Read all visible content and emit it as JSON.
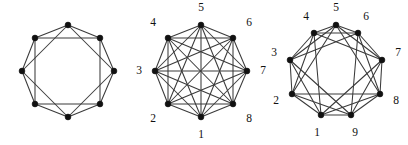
{
  "panel": {
    "name": "three-graph-figure-panel",
    "background_color": "#ffffff",
    "edge_color": "#3a3a3a",
    "vertex_color": "#111111",
    "label_color": "#111111"
  },
  "chart_data": [
    {
      "type": "diagram",
      "subtype": "graph-node-link",
      "name": "figure-1",
      "title": "",
      "labels_shown": false,
      "vertex_count": 8,
      "layout": "circular",
      "center": [
        68,
        71
      ],
      "radius": 46,
      "angle_offset_deg": -90,
      "vertex_labels": [],
      "vertex_positions": [
        [
          68,
          25
        ],
        [
          100,
          38
        ],
        [
          114,
          71
        ],
        [
          100,
          104
        ],
        [
          68,
          117
        ],
        [
          35,
          104
        ],
        [
          22,
          71
        ],
        [
          35,
          38
        ]
      ],
      "connection_distances": [
        1,
        2
      ],
      "edges": [
        [
          0,
          1
        ],
        [
          1,
          2
        ],
        [
          2,
          3
        ],
        [
          3,
          4
        ],
        [
          4,
          5
        ],
        [
          5,
          6
        ],
        [
          6,
          7
        ],
        [
          7,
          0
        ],
        [
          0,
          2
        ],
        [
          1,
          3
        ],
        [
          2,
          4
        ],
        [
          3,
          5
        ],
        [
          4,
          6
        ],
        [
          5,
          7
        ],
        [
          6,
          0
        ],
        [
          7,
          1
        ]
      ],
      "edge_count": 16
    },
    {
      "type": "diagram",
      "subtype": "graph-node-link",
      "name": "figure-2",
      "title": "",
      "labels_shown": true,
      "vertex_count": 8,
      "layout": "circular",
      "center": [
        68,
        71
      ],
      "radius": 46,
      "angle_offset_deg": 90,
      "vertex_labels": [
        "1",
        "2",
        "3",
        "4",
        "5",
        "6",
        "7",
        "8"
      ],
      "vertex_positions": [
        [
          68,
          117
        ],
        [
          35,
          104
        ],
        [
          22,
          71
        ],
        [
          35,
          38
        ],
        [
          68,
          25
        ],
        [
          100,
          38
        ],
        [
          114,
          71
        ],
        [
          100,
          104
        ]
      ],
      "label_positions": [
        [
          68,
          135
        ],
        [
          20,
          119
        ],
        [
          6,
          71
        ],
        [
          20,
          23
        ],
        [
          68,
          8
        ],
        [
          116,
          23
        ],
        [
          130,
          71
        ],
        [
          116,
          119
        ]
      ],
      "connection_distances": [
        1,
        2,
        3,
        4
      ],
      "graph_name": "K8",
      "edges": [
        [
          0,
          1
        ],
        [
          0,
          2
        ],
        [
          0,
          3
        ],
        [
          0,
          4
        ],
        [
          0,
          5
        ],
        [
          0,
          6
        ],
        [
          0,
          7
        ],
        [
          1,
          2
        ],
        [
          1,
          3
        ],
        [
          1,
          4
        ],
        [
          1,
          5
        ],
        [
          1,
          6
        ],
        [
          1,
          7
        ],
        [
          2,
          3
        ],
        [
          2,
          4
        ],
        [
          2,
          5
        ],
        [
          2,
          6
        ],
        [
          2,
          7
        ],
        [
          3,
          4
        ],
        [
          3,
          5
        ],
        [
          3,
          6
        ],
        [
          3,
          7
        ],
        [
          4,
          5
        ],
        [
          4,
          6
        ],
        [
          4,
          7
        ],
        [
          5,
          6
        ],
        [
          5,
          7
        ],
        [
          6,
          7
        ]
      ],
      "edge_count": 28
    },
    {
      "type": "diagram",
      "subtype": "graph-node-link",
      "name": "figure-3",
      "title": "",
      "labels_shown": true,
      "vertex_count": 9,
      "layout": "circular",
      "center": [
        70,
        71
      ],
      "radius": 46,
      "angle_offset_deg": 90,
      "vertex_labels": [
        "1",
        "2",
        "3",
        "4",
        "5",
        "6",
        "7",
        "8",
        "9"
      ],
      "vertex_positions": [
        [
          55,
          115
        ],
        [
          26,
          94
        ],
        [
          24,
          60
        ],
        [
          48,
          33
        ],
        [
          70,
          25
        ],
        [
          92,
          33
        ],
        [
          116,
          60
        ],
        [
          114,
          94
        ],
        [
          85,
          115
        ]
      ],
      "label_positions": [
        [
          51,
          133
        ],
        [
          10,
          101
        ],
        [
          8,
          53
        ],
        [
          40,
          17
        ],
        [
          70,
          8
        ],
        [
          100,
          17
        ],
        [
          132,
          53
        ],
        [
          130,
          101
        ],
        [
          89,
          133
        ]
      ],
      "connection_distances": [
        1,
        2,
        3
      ],
      "edges": [
        [
          0,
          1
        ],
        [
          1,
          2
        ],
        [
          2,
          3
        ],
        [
          3,
          4
        ],
        [
          4,
          5
        ],
        [
          5,
          6
        ],
        [
          6,
          7
        ],
        [
          7,
          8
        ],
        [
          8,
          0
        ],
        [
          0,
          2
        ],
        [
          1,
          3
        ],
        [
          2,
          4
        ],
        [
          3,
          5
        ],
        [
          4,
          6
        ],
        [
          5,
          7
        ],
        [
          6,
          8
        ],
        [
          7,
          0
        ],
        [
          8,
          1
        ],
        [
          0,
          3
        ],
        [
          1,
          4
        ],
        [
          2,
          5
        ],
        [
          3,
          6
        ],
        [
          4,
          7
        ],
        [
          5,
          8
        ],
        [
          6,
          0
        ],
        [
          7,
          1
        ],
        [
          8,
          2
        ]
      ],
      "edge_count": 27
    }
  ]
}
